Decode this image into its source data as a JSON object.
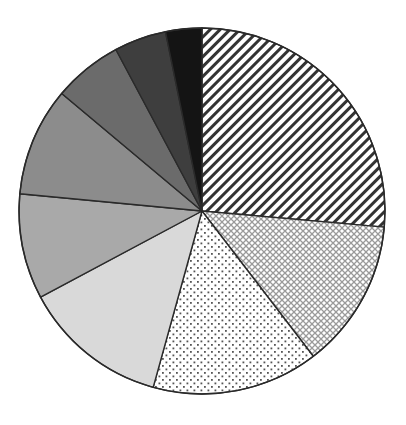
{
  "chart_data": {
    "type": "pie",
    "title": "",
    "legend": "none",
    "labels_visible": false,
    "start_angle_deg": 0,
    "direction": "clockwise",
    "categories": [
      "Slice 1",
      "Slice 2",
      "Slice 3",
      "Slice 4",
      "Slice 5",
      "Slice 6",
      "Slice 7",
      "Slice 8",
      "Slice 9"
    ],
    "values": [
      26.4,
      13.2,
      14.7,
      12.9,
      9.3,
      9.6,
      6.1,
      4.6,
      3.2
    ],
    "fills": [
      {
        "pattern": "diagonal-stripes",
        "color": "#333333",
        "background": "#ffffff"
      },
      {
        "pattern": "crosshatch",
        "color": "#9a9a9a",
        "background": "#ffffff"
      },
      {
        "pattern": "dots",
        "color": "#555555",
        "background": "#ffffff"
      },
      {
        "pattern": "solid",
        "color": "#d9d9d9"
      },
      {
        "pattern": "solid",
        "color": "#a9a9a9"
      },
      {
        "pattern": "solid",
        "color": "#8c8c8c"
      },
      {
        "pattern": "solid",
        "color": "#6b6b6b"
      },
      {
        "pattern": "solid",
        "color": "#3e3e3e"
      },
      {
        "pattern": "solid",
        "color": "#141414"
      }
    ],
    "geometry": {
      "cx": 202,
      "cy": 211,
      "r": 183
    }
  }
}
